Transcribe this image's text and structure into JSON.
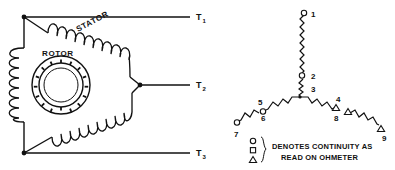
{
  "diagram": {
    "ink_color": "#111111",
    "background": "#ffffff"
  },
  "delta_diagram": {
    "stator_label": "STATOR",
    "rotor_label": "ROTOR",
    "terminals": [
      {
        "id": "T1",
        "base": "T",
        "sub": "1"
      },
      {
        "id": "T2",
        "base": "T",
        "sub": "2"
      },
      {
        "id": "T3",
        "base": "T",
        "sub": "3"
      }
    ],
    "coil_count": 3,
    "rotor_dot_count": 16
  },
  "wye_diagram": {
    "leads": [
      {
        "number": "1",
        "marker": "circle"
      },
      {
        "number": "2",
        "marker": "circle"
      },
      {
        "number": "3",
        "marker": "none"
      },
      {
        "number": "4",
        "marker": "triangle"
      },
      {
        "number": "5",
        "marker": "none"
      },
      {
        "number": "6",
        "marker": "circle"
      },
      {
        "number": "7",
        "marker": "circle"
      },
      {
        "number": "8",
        "marker": "triangle"
      },
      {
        "number": "9",
        "marker": "triangle"
      }
    ],
    "branch_count": 3
  },
  "legend": {
    "line1": "DENOTES CONTINUITY AS",
    "line2": "READ ON OHMETER",
    "symbols": [
      "circle",
      "square",
      "triangle"
    ]
  }
}
